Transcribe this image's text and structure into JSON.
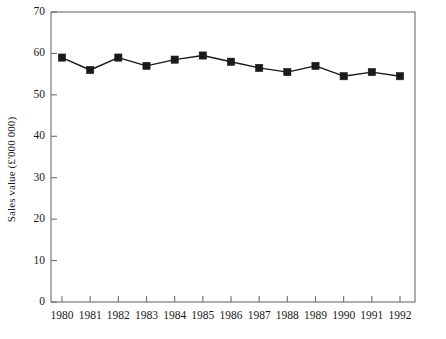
{
  "chart_data": {
    "type": "line",
    "title": "",
    "subtitle": "",
    "xlabel": "",
    "ylabel": "Sales value (£'000 000)",
    "categories": [
      "1980",
      "1981",
      "1982",
      "1983",
      "1984",
      "1985",
      "1986",
      "1987",
      "1988",
      "1989",
      "1990",
      "1991",
      "1992"
    ],
    "x": [
      1980,
      1981,
      1982,
      1983,
      1984,
      1985,
      1986,
      1987,
      1988,
      1989,
      1990,
      1991,
      1992
    ],
    "values": [
      59,
      56,
      59,
      57,
      58.5,
      59.5,
      58,
      56.5,
      55.5,
      57,
      54.5,
      55.5,
      54.5
    ],
    "series": [
      {
        "name": "Sales value",
        "values": [
          59,
          56,
          59,
          57,
          58.5,
          59.5,
          58,
          56.5,
          55.5,
          57,
          54.5,
          55.5,
          54.5
        ]
      }
    ],
    "ylim": [
      0,
      70
    ],
    "yticks": [
      0,
      10,
      20,
      30,
      40,
      50,
      60,
      70
    ],
    "ytick_labels": [
      "0",
      "10",
      "20",
      "30",
      "40",
      "50",
      "60",
      "70"
    ],
    "xtick_labels": [
      "1980",
      "1981",
      "1982",
      "1983",
      "1984",
      "1985",
      "1986",
      "1987",
      "1988",
      "1989",
      "1990",
      "1991",
      "1992"
    ],
    "grid": false,
    "legend": "none",
    "marker": "square",
    "line_color": "#1a1a1a",
    "marker_color": "#1a1a1a",
    "axis_color": "#6e6e6e",
    "background": "#ffffff"
  },
  "axis": {
    "y_label_text": "Sales value (£'000 000)"
  }
}
